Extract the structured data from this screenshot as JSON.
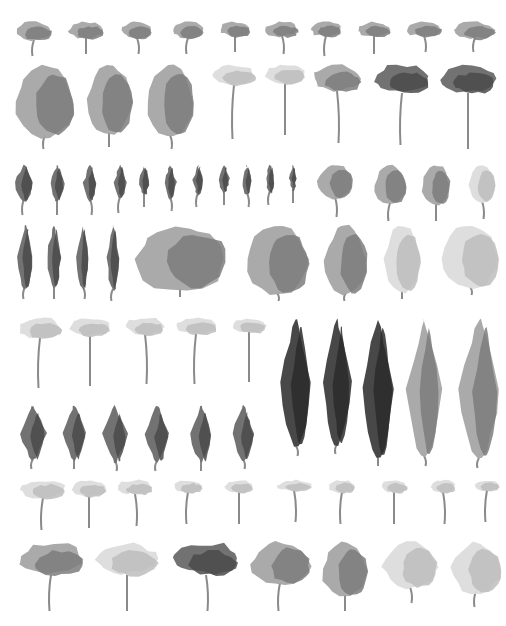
{
  "palette": {
    "background": "#ffffff",
    "light": "#dcdcdc",
    "mid": "#a5a5a5",
    "dark": "#6a6a6a",
    "darkest": "#3e3e3e",
    "trunk": "#8a8a8a"
  },
  "rows": [
    {
      "name": "row-1-small-umbrella",
      "y": 22,
      "trees": [
        {
          "x": 34,
          "w": 36,
          "h": 20,
          "stem": 16,
          "tone": "mid",
          "shape": "umbrella"
        },
        {
          "x": 86,
          "w": 34,
          "h": 18,
          "stem": 16,
          "tone": "mid",
          "shape": "umbrella"
        },
        {
          "x": 137,
          "w": 30,
          "h": 18,
          "stem": 16,
          "tone": "mid",
          "shape": "umbrella"
        },
        {
          "x": 188,
          "w": 30,
          "h": 18,
          "stem": 16,
          "tone": "mid",
          "shape": "umbrella"
        },
        {
          "x": 235,
          "w": 30,
          "h": 16,
          "stem": 16,
          "tone": "mid",
          "shape": "umbrella"
        },
        {
          "x": 282,
          "w": 32,
          "h": 16,
          "stem": 18,
          "tone": "mid",
          "shape": "umbrella"
        },
        {
          "x": 326,
          "w": 30,
          "h": 16,
          "stem": 20,
          "tone": "mid",
          "shape": "umbrella"
        },
        {
          "x": 374,
          "w": 32,
          "h": 16,
          "stem": 18,
          "tone": "mid",
          "shape": "umbrella"
        },
        {
          "x": 424,
          "w": 36,
          "h": 16,
          "stem": 16,
          "tone": "mid",
          "shape": "umbrella"
        },
        {
          "x": 475,
          "w": 40,
          "h": 18,
          "stem": 14,
          "tone": "mid",
          "shape": "umbrella"
        }
      ]
    },
    {
      "name": "row-2-large",
      "y": 65,
      "trees": [
        {
          "x": 45,
          "w": 58,
          "h": 72,
          "stem": 14,
          "tone": "mid",
          "shape": "oval"
        },
        {
          "x": 109,
          "w": 46,
          "h": 70,
          "stem": 14,
          "tone": "mid",
          "shape": "oval"
        },
        {
          "x": 170,
          "w": 48,
          "h": 72,
          "stem": 14,
          "tone": "mid",
          "shape": "oval"
        },
        {
          "x": 234,
          "w": 42,
          "h": 22,
          "stem": 54,
          "tone": "light",
          "shape": "umbrella"
        },
        {
          "x": 285,
          "w": 40,
          "h": 20,
          "stem": 52,
          "tone": "light",
          "shape": "umbrella"
        },
        {
          "x": 337,
          "w": 46,
          "h": 28,
          "stem": 52,
          "tone": "mid",
          "shape": "umbrella"
        },
        {
          "x": 402,
          "w": 52,
          "h": 30,
          "stem": 52,
          "tone": "dark",
          "shape": "umbrella"
        },
        {
          "x": 468,
          "w": 54,
          "h": 30,
          "stem": 56,
          "tone": "dark",
          "shape": "umbrella"
        }
      ]
    },
    {
      "name": "row-3-small-columnar",
      "y": 165,
      "trees": [
        {
          "x": 24,
          "w": 18,
          "h": 36,
          "stem": 16,
          "tone": "dark",
          "shape": "column"
        },
        {
          "x": 57,
          "w": 14,
          "h": 36,
          "stem": 16,
          "tone": "dark",
          "shape": "column"
        },
        {
          "x": 90,
          "w": 13,
          "h": 36,
          "stem": 16,
          "tone": "dark",
          "shape": "column"
        },
        {
          "x": 120,
          "w": 12,
          "h": 34,
          "stem": 16,
          "tone": "dark",
          "shape": "column"
        },
        {
          "x": 144,
          "w": 10,
          "h": 30,
          "stem": 14,
          "tone": "dark",
          "shape": "column"
        },
        {
          "x": 170,
          "w": 12,
          "h": 34,
          "stem": 14,
          "tone": "dark",
          "shape": "column"
        },
        {
          "x": 198,
          "w": 10,
          "h": 30,
          "stem": 14,
          "tone": "dark",
          "shape": "column"
        },
        {
          "x": 224,
          "w": 10,
          "h": 28,
          "stem": 14,
          "tone": "dark",
          "shape": "column"
        },
        {
          "x": 247,
          "w": 9,
          "h": 30,
          "stem": 14,
          "tone": "dark",
          "shape": "column"
        },
        {
          "x": 270,
          "w": 9,
          "h": 28,
          "stem": 14,
          "tone": "dark",
          "shape": "column"
        },
        {
          "x": 293,
          "w": 7,
          "h": 26,
          "stem": 14,
          "tone": "dark",
          "shape": "column"
        },
        {
          "x": 335,
          "w": 36,
          "h": 34,
          "stem": 20,
          "tone": "mid",
          "shape": "oval"
        },
        {
          "x": 390,
          "w": 32,
          "h": 40,
          "stem": 18,
          "tone": "mid",
          "shape": "oval"
        },
        {
          "x": 436,
          "w": 28,
          "h": 40,
          "stem": 18,
          "tone": "mid",
          "shape": "oval"
        },
        {
          "x": 482,
          "w": 26,
          "h": 38,
          "stem": 18,
          "tone": "light",
          "shape": "oval"
        }
      ]
    },
    {
      "name": "row-4-tall-columnar-and-broad",
      "y": 225,
      "trees": [
        {
          "x": 25,
          "w": 16,
          "h": 64,
          "stem": 12,
          "tone": "dark",
          "shape": "column"
        },
        {
          "x": 54,
          "w": 14,
          "h": 64,
          "stem": 12,
          "tone": "dark",
          "shape": "column"
        },
        {
          "x": 83,
          "w": 12,
          "h": 64,
          "stem": 12,
          "tone": "dark",
          "shape": "column"
        },
        {
          "x": 113,
          "w": 12,
          "h": 66,
          "stem": 12,
          "tone": "dark",
          "shape": "column"
        },
        {
          "x": 180,
          "w": 92,
          "h": 66,
          "stem": 8,
          "tone": "mid",
          "shape": "oval"
        },
        {
          "x": 277,
          "w": 62,
          "h": 70,
          "stem": 8,
          "tone": "mid",
          "shape": "oval"
        },
        {
          "x": 346,
          "w": 42,
          "h": 70,
          "stem": 8,
          "tone": "mid",
          "shape": "oval"
        },
        {
          "x": 402,
          "w": 36,
          "h": 68,
          "stem": 8,
          "tone": "light",
          "shape": "oval"
        },
        {
          "x": 470,
          "w": 58,
          "h": 64,
          "stem": 8,
          "tone": "light",
          "shape": "oval"
        }
      ]
    },
    {
      "name": "row-5-umbrella-and-tall-cypress",
      "y": 318,
      "trees": [
        {
          "x": 40,
          "w": 42,
          "h": 22,
          "stem": 50,
          "tone": "light",
          "shape": "umbrella"
        },
        {
          "x": 90,
          "w": 40,
          "h": 20,
          "stem": 50,
          "tone": "light",
          "shape": "umbrella"
        },
        {
          "x": 145,
          "w": 38,
          "h": 18,
          "stem": 50,
          "tone": "light",
          "shape": "umbrella"
        },
        {
          "x": 196,
          "w": 40,
          "h": 18,
          "stem": 50,
          "tone": "light",
          "shape": "umbrella"
        },
        {
          "x": 249,
          "w": 34,
          "h": 16,
          "stem": 50,
          "tone": "light",
          "shape": "umbrella"
        },
        {
          "x": 296,
          "w": 30,
          "h": 130,
          "stem": 10,
          "tone": "darkest",
          "shape": "column"
        },
        {
          "x": 337,
          "w": 28,
          "h": 128,
          "stem": 10,
          "tone": "darkest",
          "shape": "column"
        },
        {
          "x": 378,
          "w": 32,
          "h": 140,
          "stem": 10,
          "tone": "darkest",
          "shape": "column"
        },
        {
          "x": 424,
          "w": 34,
          "h": 140,
          "stem": 10,
          "tone": "mid",
          "shape": "column"
        },
        {
          "x": 479,
          "w": 40,
          "h": 142,
          "stem": 10,
          "tone": "mid",
          "shape": "column"
        }
      ]
    },
    {
      "name": "row-6-leaf-shaped",
      "y": 405,
      "trees": [
        {
          "x": 33,
          "w": 26,
          "h": 56,
          "stem": 10,
          "tone": "dark",
          "shape": "leaf"
        },
        {
          "x": 74,
          "w": 24,
          "h": 56,
          "stem": 10,
          "tone": "dark",
          "shape": "leaf"
        },
        {
          "x": 115,
          "w": 24,
          "h": 58,
          "stem": 10,
          "tone": "dark",
          "shape": "leaf"
        },
        {
          "x": 157,
          "w": 24,
          "h": 58,
          "stem": 10,
          "tone": "dark",
          "shape": "leaf"
        },
        {
          "x": 201,
          "w": 22,
          "h": 58,
          "stem": 10,
          "tone": "dark",
          "shape": "leaf"
        },
        {
          "x": 243,
          "w": 22,
          "h": 56,
          "stem": 10,
          "tone": "dark",
          "shape": "leaf"
        }
      ]
    },
    {
      "name": "row-7-small-light-umbrella",
      "y": 480,
      "trees": [
        {
          "x": 43,
          "w": 44,
          "h": 20,
          "stem": 32,
          "tone": "light",
          "shape": "umbrella"
        },
        {
          "x": 89,
          "w": 34,
          "h": 18,
          "stem": 32,
          "tone": "light",
          "shape": "umbrella"
        },
        {
          "x": 135,
          "w": 34,
          "h": 16,
          "stem": 32,
          "tone": "light",
          "shape": "umbrella"
        },
        {
          "x": 188,
          "w": 28,
          "h": 14,
          "stem": 32,
          "tone": "light",
          "shape": "umbrella"
        },
        {
          "x": 239,
          "w": 28,
          "h": 14,
          "stem": 32,
          "tone": "light",
          "shape": "umbrella"
        },
        {
          "x": 294,
          "w": 34,
          "h": 12,
          "stem": 32,
          "tone": "light",
          "shape": "umbrella"
        },
        {
          "x": 342,
          "w": 26,
          "h": 14,
          "stem": 32,
          "tone": "light",
          "shape": "umbrella"
        },
        {
          "x": 394,
          "w": 26,
          "h": 14,
          "stem": 32,
          "tone": "light",
          "shape": "umbrella"
        },
        {
          "x": 443,
          "w": 24,
          "h": 14,
          "stem": 32,
          "tone": "light",
          "shape": "umbrella"
        },
        {
          "x": 487,
          "w": 24,
          "h": 12,
          "stem": 32,
          "tone": "light",
          "shape": "umbrella"
        }
      ]
    },
    {
      "name": "row-8-broad-crowns",
      "y": 543,
      "trees": [
        {
          "x": 51,
          "w": 64,
          "h": 34,
          "stem": 36,
          "tone": "mid",
          "shape": "umbrella"
        },
        {
          "x": 127,
          "w": 60,
          "h": 34,
          "stem": 36,
          "tone": "light",
          "shape": "umbrella"
        },
        {
          "x": 206,
          "w": 64,
          "h": 34,
          "stem": 36,
          "tone": "dark",
          "shape": "umbrella"
        },
        {
          "x": 280,
          "w": 60,
          "h": 42,
          "stem": 28,
          "tone": "mid",
          "shape": "oval"
        },
        {
          "x": 345,
          "w": 46,
          "h": 54,
          "stem": 16,
          "tone": "mid",
          "shape": "oval"
        },
        {
          "x": 410,
          "w": 54,
          "h": 46,
          "stem": 16,
          "tone": "light",
          "shape": "oval"
        },
        {
          "x": 476,
          "w": 50,
          "h": 50,
          "stem": 16,
          "tone": "light",
          "shape": "oval"
        }
      ]
    }
  ]
}
